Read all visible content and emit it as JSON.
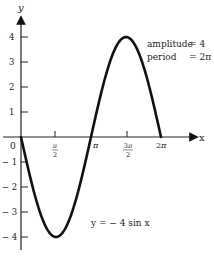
{
  "chart_data": {
    "type": "line",
    "title": "",
    "xlabel": "x",
    "ylabel": "y",
    "equation": "y = − 4 sin x",
    "annotations": [
      {
        "label": "amplitude",
        "value": "= 4"
      },
      {
        "label": "period",
        "value": "= 2π"
      }
    ],
    "x_ticks": [
      {
        "label": "0",
        "value": 0
      },
      {
        "label": "π/2",
        "value": 1.5708
      },
      {
        "label": "π",
        "value": 3.1416
      },
      {
        "label": "3π/2",
        "value": 4.7124
      },
      {
        "label": "2π",
        "value": 6.2832
      }
    ],
    "y_ticks": [
      {
        "label": "4",
        "value": 4
      },
      {
        "label": "3",
        "value": 3
      },
      {
        "label": "2",
        "value": 2
      },
      {
        "label": "1",
        "value": 1
      },
      {
        "label": "− 1",
        "value": -1
      },
      {
        "label": "− 2",
        "value": -2
      },
      {
        "label": "− 3",
        "value": -3
      },
      {
        "label": "− 4",
        "value": -4
      }
    ],
    "xlim": [
      0,
      6.2832
    ],
    "ylim": [
      -4,
      4
    ],
    "grid": false,
    "series": [
      {
        "name": "y = -4 sin x",
        "x": [
          0,
          0.7854,
          1.5708,
          2.3562,
          3.1416,
          3.927,
          4.7124,
          5.4978,
          6.2832
        ],
        "values": [
          0,
          -2.83,
          -4,
          -2.83,
          0,
          2.83,
          4,
          2.83,
          0
        ]
      }
    ]
  }
}
